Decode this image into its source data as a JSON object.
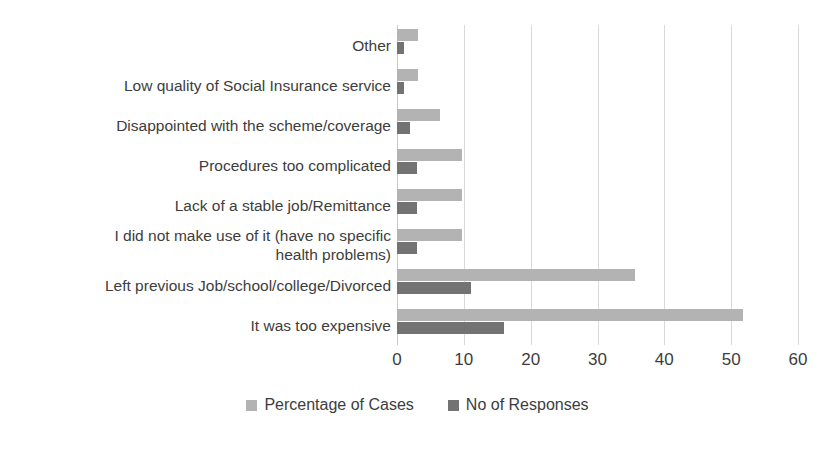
{
  "chart_data": {
    "type": "bar",
    "orientation": "horizontal",
    "title": "",
    "subtitle": "",
    "xlabel": "",
    "ylabel": "",
    "xlim": [
      0,
      60
    ],
    "xticks": [
      0,
      10,
      20,
      30,
      40,
      50,
      60
    ],
    "xtick_labels": [
      "0",
      "10",
      "20",
      "30",
      "40",
      "50",
      "60"
    ],
    "grid": true,
    "grid_axis": "x",
    "legend_position": "bottom",
    "categories": [
      "It was too expensive",
      "Left previous Job/school/college/Divorced",
      "I did not make use of it (have no specific\nhealth problems)",
      "Lack of a stable job/Remittance",
      "Procedures too complicated",
      "Disappointed with the scheme/coverage",
      "Low quality of Social Insurance service",
      "Other"
    ],
    "series": [
      {
        "name": "Percentage of Cases",
        "color": "#b3b3b3",
        "values": [
          51.8,
          35.6,
          9.7,
          9.7,
          9.7,
          6.5,
          3.2,
          3.2
        ]
      },
      {
        "name": "No of Responses",
        "color": "#737373",
        "values": [
          16,
          11,
          3,
          3,
          3,
          2,
          1,
          1
        ]
      }
    ]
  },
  "legend": {
    "items": [
      {
        "label": "Percentage of Cases",
        "color": "#b3b3b3"
      },
      {
        "label": "No of Responses",
        "color": "#737373"
      }
    ]
  },
  "colors": {
    "series_light": "#b3b3b3",
    "series_dark": "#737373",
    "gridline": "#d9d9d9",
    "axis": "#c8c8c8",
    "text": "#3d3d3d",
    "background": "#ffffff"
  }
}
